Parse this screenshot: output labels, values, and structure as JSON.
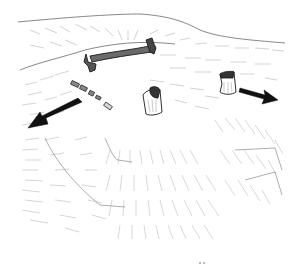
{
  "illustration": {
    "style": "pen-and-ink sketch",
    "subject": "hilltop landscape with ruined wall fragments and stumps, arrows indicating outward direction",
    "colors": {
      "background": "#ffffff",
      "ink": "#1a1a1a",
      "hatch": "#9a9a9a",
      "arrow": "#111111"
    },
    "elements": [
      {
        "name": "ridge-line",
        "description": "horizon ridge line across top"
      },
      {
        "name": "wall-fragment",
        "description": "long broken wall segment near top-center"
      },
      {
        "name": "rubble-pieces",
        "description": "small scattered blocks left of center"
      },
      {
        "name": "stump-center",
        "description": "broken column stump center"
      },
      {
        "name": "stump-right",
        "description": "broken column stump right"
      },
      {
        "name": "arrow-left",
        "description": "black arrow pointing down-left"
      },
      {
        "name": "arrow-right",
        "description": "black arrow pointing right"
      }
    ]
  }
}
